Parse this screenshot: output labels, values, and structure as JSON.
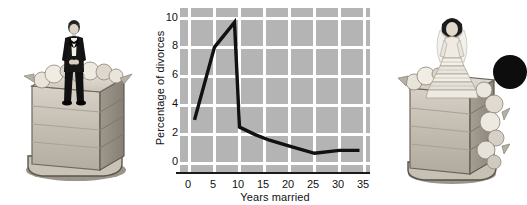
{
  "figure": {
    "background_color": "#ffffff"
  },
  "chart_data": {
    "type": "line",
    "title": "",
    "xlabel": "Years married",
    "ylabel": "Percentage of divorces",
    "xlim": [
      -2,
      36
    ],
    "ylim": [
      -0.6,
      10.6
    ],
    "xticks": [
      0,
      5,
      10,
      15,
      20,
      25,
      30,
      35
    ],
    "xtick_labels": [
      "0",
      "5",
      "10",
      "15",
      "20",
      "25",
      "30",
      "35"
    ],
    "yticks": [
      0,
      2,
      4,
      6,
      8,
      10
    ],
    "ytick_labels": [
      "0",
      "2",
      "4",
      "6",
      "8",
      "10"
    ],
    "grid": true,
    "grid_color": "#ffffff",
    "plot_background": "#b4b4b4",
    "line_color": "#111111",
    "line_width": 3.4,
    "legend": null,
    "x": [
      1,
      5,
      9,
      10,
      13,
      16,
      20,
      25,
      30,
      34
    ],
    "values": [
      3.0,
      8.0,
      9.7,
      2.5,
      2.0,
      1.6,
      1.2,
      0.7,
      0.9,
      0.9
    ],
    "series": [
      {
        "name": "Percentage of divorces",
        "x": [
          1,
          5,
          9,
          10,
          13,
          16,
          20,
          25,
          30,
          34
        ],
        "values": [
          3.0,
          8.0,
          9.7,
          2.5,
          2.0,
          1.6,
          1.2,
          0.7,
          0.9,
          0.9
        ]
      }
    ]
  },
  "images": {
    "left": {
      "caption": "wedding-cake-with-groom-figurine",
      "figurine": "groom in black tuxedo"
    },
    "right": {
      "caption": "wedding-cake-with-bride-figurine",
      "figurine": "bride in white gown"
    }
  },
  "decoration": {
    "edge_dot_color": "#0d0d0d"
  }
}
